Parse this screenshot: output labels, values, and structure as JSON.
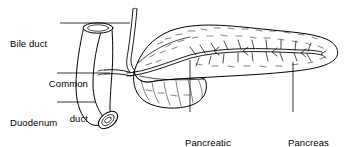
{
  "figure": {
    "background_color": "#ffffff",
    "line_color": "#000000",
    "width": 353,
    "height": 147
  },
  "labels": {
    "bile_duct": {
      "text": "Bile duct",
      "lines": [
        "Bile duct"
      ]
    },
    "common_duct": {
      "text": "Common duct",
      "lines": [
        "Common",
        "duct"
      ]
    },
    "duodenum": {
      "text": "Duodenum",
      "lines": [
        "Duodenum"
      ]
    },
    "pancreatic_duct": {
      "text": "Pancreatic duct",
      "lines": [
        "Pancreatic",
        "duct"
      ]
    },
    "pancreas_gland": {
      "text": "Pancreas gland",
      "lines": [
        "Pancreas",
        "gland"
      ]
    }
  },
  "structures": [
    {
      "name": "duodenum",
      "description": "C-shaped open tube on the left with elliptical cut opening at top and bottom"
    },
    {
      "name": "bile-duct",
      "description": "thin tube descending from top and curving into the pancreas head"
    },
    {
      "name": "common-duct",
      "description": "short duct entering the duodenal wall"
    },
    {
      "name": "pancreas-gland",
      "description": "elongated lobulated organ extending to the right"
    },
    {
      "name": "pancreatic-duct",
      "description": "branching herringbone duct running the length of the pancreas"
    }
  ]
}
